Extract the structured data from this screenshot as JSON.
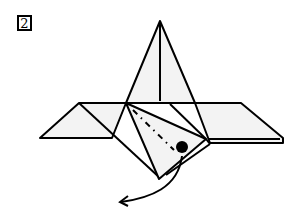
{
  "diagram": {
    "step_number": "2",
    "colors": {
      "line": "#000000",
      "paper": "#f2f2f2",
      "background": "#ffffff"
    },
    "symbols": [
      "step-number-box",
      "valley-fold-line",
      "pivot-dot",
      "curved-fold-arrow"
    ]
  }
}
